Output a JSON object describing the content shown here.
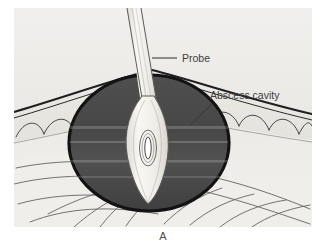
{
  "figure": {
    "caption": "A",
    "panel_background": "#efefef",
    "title_text": ""
  },
  "annotations": [
    {
      "id": "probe",
      "label": "Probe",
      "text_x": 168,
      "text_y": 54,
      "leader": {
        "x1": 138,
        "y1": 50,
        "x2": 163,
        "y2": 50
      },
      "color": "#3d3d3d"
    },
    {
      "id": "abscess-cavity",
      "label": "Abscess cavity",
      "text_x": 196,
      "text_y": 91,
      "leader": {
        "x1": 176,
        "y1": 117,
        "x2": 198,
        "y2": 96
      },
      "color": "#3d3d3d"
    }
  ],
  "structures": {
    "abscess_cavity": {
      "name": "Abscess cavity",
      "fill": "#4a4a4a",
      "outline": "#131313",
      "center_x": 135,
      "center_y": 135,
      "radius_x": 80,
      "radius_y": 68
    },
    "probe": {
      "name": "Probe",
      "fill": "#f3f1ec",
      "outline": "#555555",
      "eyelet_fill": "#ffffff"
    },
    "skin": {
      "name": "Skin surface",
      "line_color": "#2a2a2a"
    },
    "subcutaneous_fat": {
      "name": "Subcutaneous fat lobules",
      "fill": "#e9e7e2",
      "line_color": "#3c3c3c"
    },
    "muscle": {
      "name": "Muscle layer",
      "fill": "#f0eeea",
      "line_color": "#4a4a4a"
    }
  }
}
